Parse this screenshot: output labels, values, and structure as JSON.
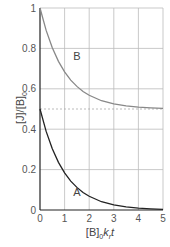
{
  "chart_data": {
    "type": "line",
    "title": "",
    "xlabel": "[B]₀kᵣt",
    "xlabel_parts": {
      "main": "[B]",
      "sub": "0",
      "rest": "k",
      "rest_sub": "r",
      "tail": "t"
    },
    "ylabel_parts": {
      "main": "[J]/[B]",
      "sub": "0"
    },
    "xlim": [
      0,
      5
    ],
    "ylim": [
      0,
      1
    ],
    "xticks": [
      "0",
      "1",
      "2",
      "3",
      "4",
      "5"
    ],
    "yticks": [
      "0",
      "0.2",
      "0.4",
      "0.6",
      "0.8",
      "1"
    ],
    "grid": true,
    "reference_line": {
      "y": 0.5,
      "style": "dashed"
    },
    "x": [
      0,
      0.25,
      0.5,
      0.75,
      1,
      1.25,
      1.5,
      1.75,
      2,
      2.5,
      3,
      3.5,
      4,
      4.5,
      5
    ],
    "series": [
      {
        "name": "A",
        "color": "#222222",
        "values": [
          0.5,
          0.389,
          0.303,
          0.236,
          0.184,
          0.143,
          0.112,
          0.087,
          0.068,
          0.041,
          0.025,
          0.015,
          0.009,
          0.006,
          0.003
        ]
      },
      {
        "name": "B",
        "color": "#888888",
        "values": [
          1.0,
          0.889,
          0.803,
          0.736,
          0.684,
          0.643,
          0.612,
          0.587,
          0.568,
          0.541,
          0.525,
          0.515,
          0.509,
          0.506,
          0.503
        ]
      }
    ],
    "annotations": [
      {
        "text": "A",
        "x": 1.5,
        "y": 0.09
      },
      {
        "text": "B",
        "x": 1.5,
        "y": 0.76
      }
    ]
  }
}
